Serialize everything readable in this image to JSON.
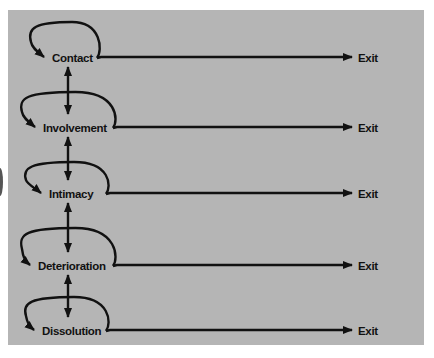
{
  "diagram": {
    "title": "",
    "stages": [
      {
        "label": "Contact",
        "exit_label": "Exit"
      },
      {
        "label": "Involvement",
        "exit_label": "Exit"
      },
      {
        "label": "Intimacy",
        "exit_label": "Exit"
      },
      {
        "label": "Deterioration",
        "exit_label": "Exit"
      },
      {
        "label": "Dissolution",
        "exit_label": "Exit"
      }
    ],
    "connections": {
      "between_stages": "bidirectional",
      "self_loops": true,
      "exits": true
    },
    "colors": {
      "background": "#b5b5b5",
      "stroke": "#111111",
      "page": "#ffffff"
    }
  }
}
